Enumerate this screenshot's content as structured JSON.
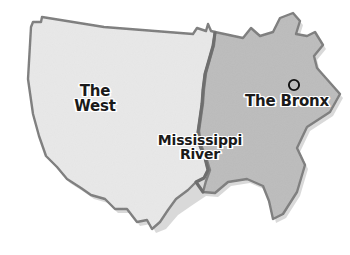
{
  "figure": {
    "kind": "map-diagram",
    "background_color": "#ffffff",
    "width": 350,
    "height": 255
  },
  "regions": [
    {
      "id": "west",
      "label": "The\nWest",
      "label_line1": "The",
      "label_line2": "West",
      "fill_color": "#e8e8e8",
      "outline_color": "#7d7d7d"
    },
    {
      "id": "east",
      "label": "",
      "fill_color": "#bcbcbc",
      "outline_color": "#7d7d7d"
    }
  ],
  "boundary": {
    "id": "mississippi-river",
    "label": "Mississippi\nRiver",
    "label_line1": "Mississippi",
    "label_line2": "River",
    "stroke_color": "#6e6e6e"
  },
  "markers": [
    {
      "id": "the-bronx",
      "label": "The Bronx",
      "marker_shape": "circle-outline",
      "marker_color": "#111111",
      "label_color": "#1a1a1a"
    }
  ],
  "colors": {
    "west_fill": "#e8e8e8",
    "east_fill": "#bcbcbc",
    "outline": "#7d7d7d",
    "river": "#6e6e6e",
    "text": "#1a1a1a",
    "text_halo": "#ffffff",
    "shadow": "#9a9a9a"
  }
}
